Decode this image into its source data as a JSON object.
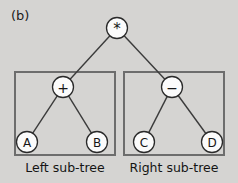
{
  "figure": {
    "panel_label": "(b)",
    "background_color": "#d5d4d2",
    "node_fill_color": "#fbfbfb",
    "node_stroke_color": "#2a2a2a",
    "edge_color": "#3b3b3b",
    "box_stroke_color": "#6d6d6d"
  },
  "tree": {
    "root": {
      "label": "*",
      "cx": 117,
      "cy": 28,
      "r": 10.5
    },
    "nodes": [
      {
        "id": "root",
        "label": "*",
        "cx": 117,
        "cy": 28,
        "r": 10.5
      },
      {
        "id": "plus",
        "label": "+",
        "cx": 63,
        "cy": 87,
        "r": 10.5
      },
      {
        "id": "minus",
        "label": "−",
        "cx": 172,
        "cy": 87,
        "r": 10.5
      },
      {
        "id": "a",
        "label": "A",
        "cx": 27,
        "cy": 142,
        "r": 10.5
      },
      {
        "id": "b",
        "label": "B",
        "cx": 97,
        "cy": 142,
        "r": 10.5
      },
      {
        "id": "c",
        "label": "C",
        "cx": 144,
        "cy": 142,
        "r": 10.5
      },
      {
        "id": "d",
        "label": "D",
        "cx": 212,
        "cy": 142,
        "r": 10.5
      }
    ],
    "edges": [
      {
        "from": "root",
        "to": "plus"
      },
      {
        "from": "root",
        "to": "minus"
      },
      {
        "from": "plus",
        "to": "a"
      },
      {
        "from": "plus",
        "to": "b"
      },
      {
        "from": "minus",
        "to": "c"
      },
      {
        "from": "minus",
        "to": "d"
      }
    ]
  },
  "subtrees": [
    {
      "id": "left",
      "caption": "Left sub-tree",
      "box": {
        "x": 15,
        "y": 72,
        "width": 100,
        "height": 83
      }
    },
    {
      "id": "right",
      "caption": "Right sub-tree",
      "box": {
        "x": 124,
        "y": 72,
        "width": 100,
        "height": 83
      }
    }
  ]
}
